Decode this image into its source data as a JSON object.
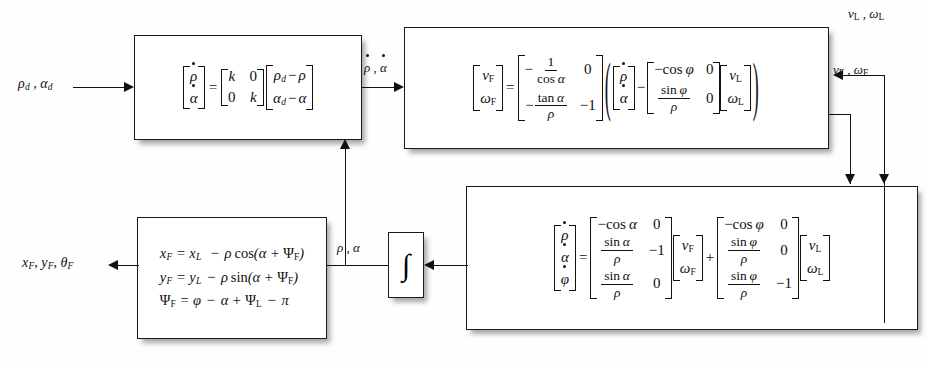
{
  "diagram": {
    "type": "control-block-diagram",
    "background": "#ffffff",
    "line_color": "#111111"
  },
  "signals": {
    "input_desired": "ρd , αd",
    "rho_alpha_dot": "ρ̇ , α̇",
    "rho_alpha": "ρ , α",
    "leader_velocity": "vL , ωL",
    "follower_velocity": "vF , ωF",
    "output_pose": "xF , yF , θF"
  },
  "blocks": {
    "controller": {
      "name": "proportional-controller",
      "lhs": [
        "ρ̇",
        "α̇"
      ],
      "gain_matrix": [
        [
          "k",
          "0"
        ],
        [
          "0",
          "k"
        ]
      ],
      "error_vector": [
        "ρd − ρ",
        "αd − α"
      ]
    },
    "inverse_kinematics": {
      "name": "follower-velocity-solver",
      "lhs": [
        "vF",
        "ωF"
      ],
      "lead_matrix": [
        [
          "−1/cos α",
          "0"
        ],
        [
          "−tan α / ρ",
          "−1"
        ]
      ],
      "state_vector": [
        "ρ̇",
        "α̇"
      ],
      "minus_matrix": [
        [
          "−cos φ",
          "0"
        ],
        [
          "sin φ / ρ",
          "0"
        ]
      ],
      "leader_vector": [
        "vL",
        "ωL"
      ]
    },
    "kinematics": {
      "name": "formation-kinematics",
      "lhs": [
        "ρ̇",
        "α̇",
        "φ̇"
      ],
      "follower_matrix": [
        [
          "−cos α",
          "0"
        ],
        [
          "sin α / ρ",
          "−1"
        ],
        [
          "sin α / ρ",
          "0"
        ]
      ],
      "follower_vector": [
        "vF",
        "ωF"
      ],
      "leader_matrix": [
        [
          "−cos φ",
          "0"
        ],
        [
          "sin φ / ρ",
          "0"
        ],
        [
          "sin φ / ρ",
          "−1"
        ]
      ],
      "leader_vector": [
        "vL",
        "ωL"
      ]
    },
    "integrator": {
      "name": "integrator",
      "symbol": "∫"
    },
    "pose_reconstruction": {
      "name": "follower-pose-equations",
      "equations": [
        "xF = xL  − ρ cos(α + ΨF)",
        "yF = yL − ρ sin(α + ΨF)",
        "ΨF = φ − α + ΨL − π"
      ]
    }
  },
  "symbols": {
    "k": "k",
    "zero": "0",
    "one": "1",
    "minus_one": "−1",
    "rho": "ρ",
    "alpha": "α",
    "phi": "φ",
    "cos_alpha": "cos α",
    "tan_alpha": "tan α",
    "sin_alpha": "sin α",
    "cos_phi": "cos φ",
    "sin_phi": "sin φ",
    "v_F": "vF",
    "w_F": "ωF",
    "v_L": "vL",
    "w_L": "ωL"
  }
}
